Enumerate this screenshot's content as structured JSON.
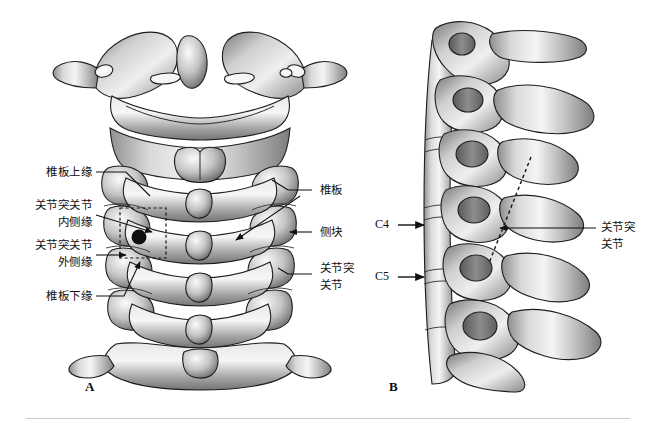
{
  "figure": {
    "title_alt": "颈椎后面观与侧面观解剖示意图",
    "background": "#ffffff",
    "ink": "#111111",
    "bone_light": "#f2f2f2",
    "bone_mid": "#9a9a9a",
    "bone_dark": "#4a4a4a"
  },
  "panels": [
    {
      "letter": "A",
      "view": "posterior-view-cervical-spine"
    },
    {
      "letter": "B",
      "view": "lateral-view-cervical-spine"
    }
  ],
  "panel_a": {
    "letter": "A",
    "labels_left": [
      {
        "id": "lamina-superior-border",
        "lines": [
          "椎板上缘"
        ]
      },
      {
        "id": "facet-joint-medial-border",
        "lines": [
          "关节突关节",
          "内侧缘"
        ]
      },
      {
        "id": "facet-joint-lateral-border",
        "lines": [
          "关节突关节",
          "外侧缘"
        ]
      },
      {
        "id": "lamina-inferior-border",
        "lines": [
          "椎板下缘"
        ]
      }
    ],
    "labels_right": [
      {
        "id": "lamina",
        "lines": [
          "椎板"
        ]
      },
      {
        "id": "lateral-mass",
        "lines": [
          "侧块"
        ]
      },
      {
        "id": "facet-joint",
        "lines": [
          "关节突",
          "关节"
        ]
      }
    ],
    "entry_point_marker": "black-dot",
    "target_box": "dashed-rectangle"
  },
  "panel_b": {
    "letter": "B",
    "vertebra_marks": [
      {
        "id": "c4",
        "text": "C4"
      },
      {
        "id": "c5",
        "text": "C5"
      }
    ],
    "labels_right": [
      {
        "id": "facet-joint",
        "lines": [
          "关节突",
          "关节"
        ]
      }
    ],
    "trajectory_line": "dotted-screw-trajectory"
  }
}
